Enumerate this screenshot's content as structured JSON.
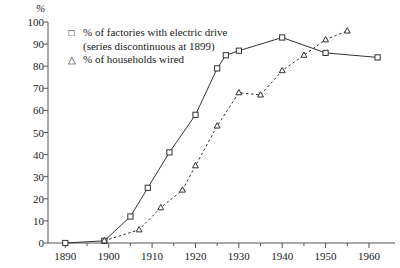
{
  "chart_data": {
    "type": "line",
    "title": "",
    "subtitle": "",
    "xlabel": "",
    "ylabel": "%",
    "ylim": [
      0,
      100
    ],
    "xlim": [
      1886,
      1966
    ],
    "grid": false,
    "legend_position": "top-left",
    "ytick_labels": [
      "0",
      "10",
      "20",
      "30",
      "40",
      "50",
      "60",
      "70",
      "80",
      "90",
      "100"
    ],
    "ytick_values": [
      0,
      10,
      20,
      30,
      40,
      50,
      60,
      70,
      80,
      90,
      100
    ],
    "xtick_labels": [
      "1890",
      "1900",
      "1910",
      "1920",
      "1930",
      "1940",
      "1950",
      "1960"
    ],
    "xtick_values": [
      1890,
      1900,
      1910,
      1920,
      1930,
      1940,
      1950,
      1960
    ],
    "series": [
      {
        "name": "% of factories with electric drive",
        "note": "(series discontinuous at 1899)",
        "marker": "square",
        "line_style": "solid",
        "color": "#333333",
        "points": [
          {
            "x": 1890,
            "y": 0
          },
          {
            "x": 1899,
            "y": 1
          },
          {
            "x": 1905,
            "y": 12
          },
          {
            "x": 1909,
            "y": 25
          },
          {
            "x": 1914,
            "y": 41
          },
          {
            "x": 1920,
            "y": 58
          },
          {
            "x": 1925,
            "y": 79
          },
          {
            "x": 1927,
            "y": 85
          },
          {
            "x": 1930,
            "y": 87
          },
          {
            "x": 1940,
            "y": 93
          },
          {
            "x": 1950,
            "y": 86
          },
          {
            "x": 1962,
            "y": 84
          }
        ]
      },
      {
        "name": "% of households wired",
        "note": "",
        "marker": "triangle",
        "line_style": "dashed",
        "color": "#333333",
        "points": [
          {
            "x": 1899,
            "y": 1
          },
          {
            "x": 1907,
            "y": 6
          },
          {
            "x": 1912,
            "y": 16
          },
          {
            "x": 1917,
            "y": 24
          },
          {
            "x": 1920,
            "y": 35
          },
          {
            "x": 1925,
            "y": 53
          },
          {
            "x": 1930,
            "y": 68
          },
          {
            "x": 1935,
            "y": 67
          },
          {
            "x": 1940,
            "y": 78
          },
          {
            "x": 1945,
            "y": 85
          },
          {
            "x": 1950,
            "y": 92
          },
          {
            "x": 1955,
            "y": 96
          }
        ]
      }
    ]
  },
  "legend": {
    "entries": [
      {
        "marker_glyph": "□",
        "label": "% of factories with electric drive",
        "sub": "(series discontinuous at 1899)"
      },
      {
        "marker_glyph": "△",
        "label": "% of households wired",
        "sub": ""
      }
    ]
  },
  "axis": {
    "unit_label": "%"
  }
}
